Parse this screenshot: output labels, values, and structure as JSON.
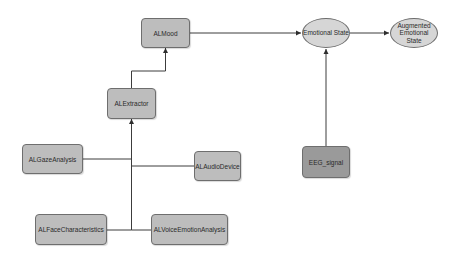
{
  "diagram": {
    "nodes": {
      "almood": {
        "label": "ALMood"
      },
      "alextractor": {
        "label": "ALExtractor"
      },
      "emotional_state": {
        "label": "Emotional State"
      },
      "augmented_state": {
        "label": "Augmented Emotional State"
      },
      "eeg_signal": {
        "label": "EEG_signal"
      },
      "algaze": {
        "label": "ALGazeAnalysis"
      },
      "alaudio": {
        "label": "ALAudioDevice"
      },
      "alface": {
        "label": "ALFaceCharacteristics"
      },
      "alvoice": {
        "label": "ALVoiceEmotionAnalysis"
      }
    },
    "edges": [
      {
        "from": "ALExtractor",
        "to": "ALMood"
      },
      {
        "from": "ALMood",
        "to": "Emotional State"
      },
      {
        "from": "Emotional State",
        "to": "Augmented Emotional State"
      },
      {
        "from": "EEG_signal",
        "to": "Emotional State"
      },
      {
        "from": "ALGazeAnalysis",
        "to": "ALExtractor"
      },
      {
        "from": "ALAudioDevice",
        "to": "ALExtractor"
      },
      {
        "from": "ALFaceCharacteristics",
        "to": "ALExtractor"
      },
      {
        "from": "ALVoiceEmotionAnalysis",
        "to": "ALExtractor"
      }
    ],
    "colors": {
      "node_fill": "#bdbdbd",
      "eeg_fill": "#9a9a9a",
      "ellipse_fill": "#d6d6d6",
      "stroke": "#6e6e6e",
      "edge": "#3c3c3c"
    }
  }
}
